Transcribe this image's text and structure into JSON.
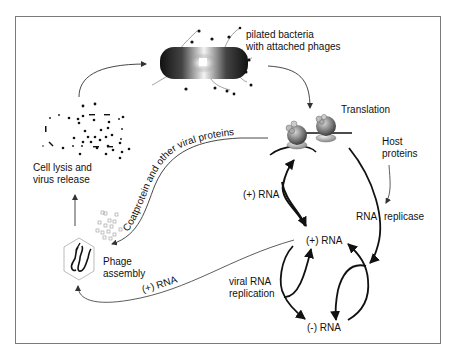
{
  "diagram": {
    "nodes": {
      "bacteria": {
        "label_line1": "pilated bacteria",
        "label_line2": "with attached phages"
      },
      "translation": {
        "label": "Translation"
      },
      "host_proteins": {
        "label_line1": "Host",
        "label_line2": "proteins"
      },
      "rna_replicase": {
        "label_part1": "RNA",
        "label_part2": "replicase"
      },
      "plus_rna_top": {
        "label": "(+) RNA"
      },
      "plus_rna_center": {
        "label": "(+) RNA"
      },
      "minus_rna": {
        "label": "(-) RNA"
      },
      "viral_rna_replication": {
        "label_line1": "viral RNA",
        "label_line2": "replication"
      },
      "phage_assembly": {
        "label_line1": "Phage",
        "label_line2": "assembly"
      },
      "cell_lysis": {
        "label_line1": "Cell lysis and",
        "label_line2": "virus release"
      }
    },
    "edges": {
      "coatprotein": {
        "label": "Coatprotein and other viral proteins"
      },
      "plus_rna_to_assembly": {
        "label": "(+) RNA"
      }
    },
    "colors": {
      "frame": "#7a7a7a",
      "arrow": "#111111",
      "thin_arrow": "#333333",
      "text": "#111111"
    }
  }
}
